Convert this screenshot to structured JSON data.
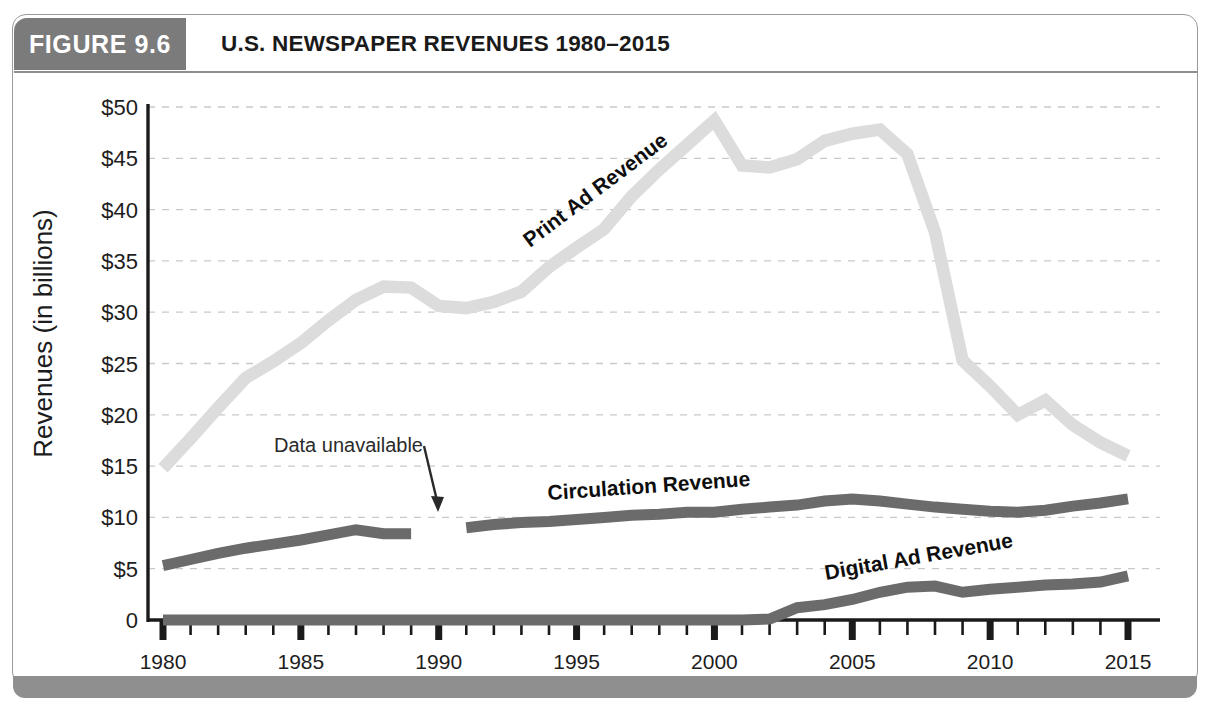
{
  "figure": {
    "number_label": "FIGURE 9.6",
    "title": "U.S. NEWSPAPER REVENUES 1980–2015"
  },
  "colors": {
    "badge_gray": "#7b7b7b",
    "footer_gray": "#8f8f8f",
    "print_ad": "#dcdcdc",
    "circulation": "#6b6b6b",
    "digital_ad": "#6b6b6b",
    "axis": "#1a1a1a",
    "gridline": "#c9c9c9"
  },
  "annotations": [
    {
      "name": "data-unavailable",
      "text": "Data unavailable"
    }
  ],
  "chart_data": {
    "type": "line",
    "title": "U.S. NEWSPAPER REVENUES 1980–2015",
    "xlabel": "",
    "ylabel": "Revenues (in billions)",
    "ylim": [
      0,
      50
    ],
    "xlim": [
      1980,
      2015
    ],
    "grid": true,
    "legend": "inline-labels",
    "ytick_labels": [
      "$50",
      "$45",
      "$40",
      "$35",
      "$30",
      "$25",
      "$20",
      "$15",
      "$10",
      "$5",
      "0"
    ],
    "ytick_values": [
      50,
      45,
      40,
      35,
      30,
      25,
      20,
      15,
      10,
      5,
      0
    ],
    "xtick_labels": [
      "1980",
      "1985",
      "1990",
      "1995",
      "2000",
      "2005",
      "2010",
      "2015"
    ],
    "xtick_values": [
      1980,
      1985,
      1990,
      1995,
      2000,
      2005,
      2010,
      2015
    ],
    "x": [
      1980,
      1981,
      1982,
      1983,
      1984,
      1985,
      1986,
      1987,
      1988,
      1989,
      1990,
      1991,
      1992,
      1993,
      1994,
      1995,
      1996,
      1997,
      1998,
      1999,
      2000,
      2001,
      2002,
      2003,
      2004,
      2005,
      2006,
      2007,
      2008,
      2009,
      2010,
      2011,
      2012,
      2013,
      2014,
      2015
    ],
    "series": [
      {
        "name": "Print Ad Revenue",
        "label": "Print Ad Revenue",
        "color": "#dcdcdc",
        "values": [
          14.8,
          17.7,
          20.7,
          23.6,
          25.2,
          27.0,
          29.2,
          31.2,
          32.5,
          32.4,
          30.6,
          30.4,
          31.0,
          32.0,
          34.4,
          36.3,
          38.1,
          41.3,
          43.9,
          46.3,
          48.7,
          44.3,
          44.1,
          44.9,
          46.7,
          47.4,
          47.8,
          45.4,
          37.8,
          25.3,
          22.8,
          20.0,
          21.4,
          19.0,
          17.3,
          16.0
        ]
      },
      {
        "name": "Circulation Revenue",
        "label": "Circulation Revenue",
        "color": "#6b6b6b",
        "values": [
          5.3,
          5.9,
          6.5,
          7.0,
          7.4,
          7.8,
          8.3,
          8.8,
          8.4,
          8.4,
          null,
          9.0,
          9.3,
          9.5,
          9.6,
          9.8,
          10.0,
          10.2,
          10.3,
          10.5,
          10.5,
          10.8,
          11.0,
          11.2,
          11.6,
          11.8,
          11.6,
          11.3,
          11.0,
          10.8,
          10.6,
          10.5,
          10.7,
          11.1,
          11.4,
          11.8
        ]
      },
      {
        "name": "Digital Ad Revenue",
        "label": "Digital Ad Revenue",
        "color": "#6b6b6b",
        "values": [
          0,
          0,
          0,
          0,
          0,
          0,
          0,
          0,
          0,
          0,
          0,
          0,
          0,
          0,
          0,
          0,
          0,
          0,
          0,
          0,
          0,
          0,
          0.1,
          1.2,
          1.5,
          2.0,
          2.7,
          3.2,
          3.3,
          2.7,
          3.0,
          3.2,
          3.4,
          3.5,
          3.7,
          4.3
        ]
      }
    ]
  }
}
